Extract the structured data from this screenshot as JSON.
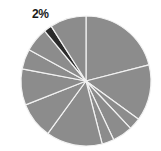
{
  "chart_data": {
    "type": "pie",
    "title": "",
    "start_angle_deg": 0,
    "direction": "clockwise",
    "slices": [
      {
        "value": 21,
        "color": "#8c8c8c",
        "label": ""
      },
      {
        "value": 14,
        "color": "#8c8c8c",
        "label": ""
      },
      {
        "value": 3,
        "color": "#8c8c8c",
        "label": ""
      },
      {
        "value": 5,
        "color": "#8c8c8c",
        "label": ""
      },
      {
        "value": 3,
        "color": "#8c8c8c",
        "label": ""
      },
      {
        "value": 14,
        "color": "#8c8c8c",
        "label": ""
      },
      {
        "value": 9,
        "color": "#8c8c8c",
        "label": ""
      },
      {
        "value": 9,
        "color": "#8c8c8c",
        "label": ""
      },
      {
        "value": 5,
        "color": "#8c8c8c",
        "label": ""
      },
      {
        "value": 6,
        "color": "#8c8c8c",
        "label": ""
      },
      {
        "value": 2,
        "color": "#2b2b2b",
        "label": "2%"
      },
      {
        "value": 9,
        "color": "#8c8c8c",
        "label": ""
      }
    ],
    "annotations": [
      {
        "text": "2%",
        "slice_index": 10
      }
    ],
    "legend": null
  },
  "labels": {
    "highlight": "2%"
  },
  "geometry": {
    "cx": 86,
    "cy": 81,
    "r": 65,
    "separator_color": "#f2f2f2"
  }
}
